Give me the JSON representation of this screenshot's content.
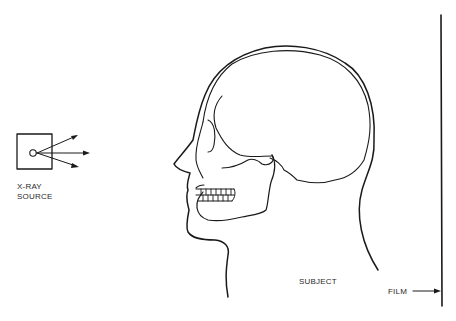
{
  "diagram": {
    "labels": {
      "source_line1": "X-RAY",
      "source_line2": "SOURCE",
      "subject": "SUBJECT",
      "film": "FILM"
    },
    "colors": {
      "background": "#ffffff",
      "ink": "#1a1a1a",
      "text": "#2a2a2a"
    },
    "components": [
      {
        "id": "xray-source",
        "shape": "square-with-circle",
        "emits": 3
      },
      {
        "id": "subject",
        "shape": "skull-in-head-profile",
        "facing": "left"
      },
      {
        "id": "film",
        "shape": "vertical-line"
      }
    ]
  }
}
